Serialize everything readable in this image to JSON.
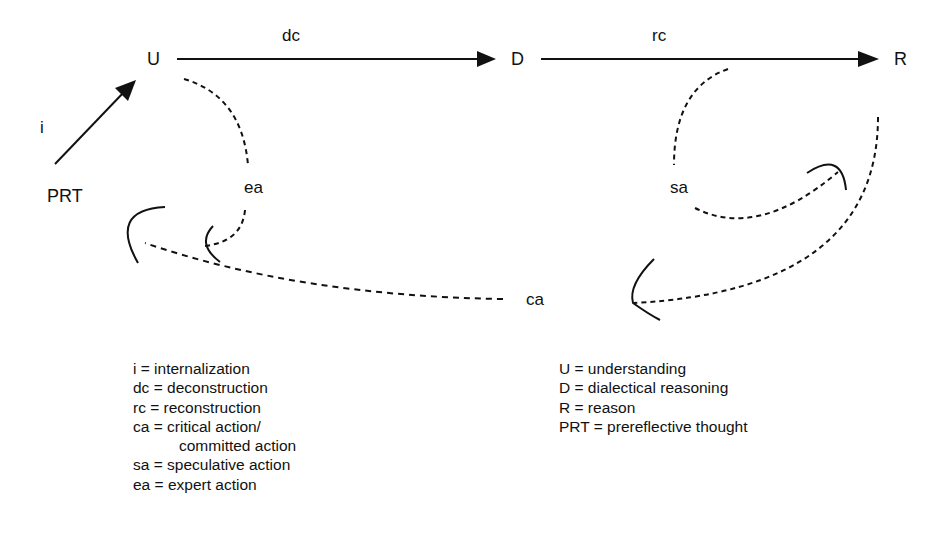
{
  "diagram": {
    "nodes": {
      "U": "U",
      "D": "D",
      "R": "R",
      "PRT": "PRT"
    },
    "edges": {
      "i": "i",
      "dc": "dc",
      "rc": "rc",
      "ea": "ea",
      "sa": "sa",
      "ca": "ca"
    }
  },
  "legend_left": [
    "i = internalization",
    "dc = deconstruction",
    "rc = reconstruction",
    "ca = critical action/",
    "committed action",
    "sa = speculative action",
    "ea = expert action"
  ],
  "legend_right": [
    "U = understanding",
    "D = dialectical reasoning",
    "R = reason",
    "PRT = prereflective thought"
  ],
  "colors": {
    "ink": "#111111",
    "background": "#ffffff"
  }
}
